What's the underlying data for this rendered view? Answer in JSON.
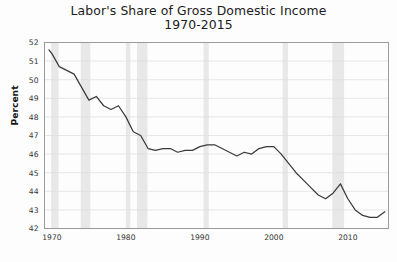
{
  "chart_data": {
    "type": "line",
    "title": "Labor's Share of Gross Domestic Income",
    "subtitle": "1970-2015",
    "xlabel": "",
    "ylabel": "Percent",
    "xlim": [
      1969,
      2015.5
    ],
    "ylim": [
      42,
      52
    ],
    "yticks": [
      42,
      43,
      44,
      45,
      46,
      47,
      48,
      49,
      50,
      51,
      52
    ],
    "ytick_labels": [
      "42",
      "43",
      "44",
      "45",
      "46",
      "47",
      "48",
      "49",
      "50",
      "51",
      "52"
    ],
    "xticks": [
      1970,
      1980,
      1990,
      2000,
      2010
    ],
    "xtick_labels": [
      "1970",
      "1980",
      "1990",
      "2000",
      "2010"
    ],
    "grid": "horizontal",
    "legend": "none",
    "line_color": "#3a3a3a",
    "recession_band_color": "#e8e8e8",
    "series": [
      {
        "name": "Labor's Share of Gross Domestic Income",
        "x": [
          1969.6,
          1970,
          1971,
          1972,
          1973,
          1974,
          1975,
          1976,
          1977,
          1978,
          1979,
          1980,
          1981,
          1982,
          1983,
          1984,
          1985,
          1986,
          1987,
          1988,
          1989,
          1990,
          1991,
          1992,
          1993,
          1994,
          1995,
          1996,
          1997,
          1998,
          1999,
          2000,
          2001,
          2002,
          2003,
          2004,
          2005,
          2006,
          2007,
          2008,
          2009,
          2010,
          2011,
          2012,
          2013,
          2014,
          2015
        ],
        "values": [
          51.6,
          51.4,
          50.7,
          50.5,
          50.3,
          49.6,
          48.9,
          49.1,
          48.6,
          48.4,
          48.6,
          48.0,
          47.2,
          47.0,
          46.3,
          46.2,
          46.3,
          46.3,
          46.1,
          46.2,
          46.2,
          46.4,
          46.5,
          46.5,
          46.3,
          46.1,
          45.9,
          46.1,
          46.0,
          46.3,
          46.4,
          46.4,
          46.0,
          45.5,
          45.0,
          44.6,
          44.2,
          43.8,
          43.6,
          43.9,
          44.4,
          43.6,
          43.0,
          42.7,
          42.6,
          42.6,
          42.9
        ]
      }
    ],
    "recession_bands": [
      {
        "start": 1969.9,
        "end": 1970.9
      },
      {
        "start": 1973.9,
        "end": 1975.2
      },
      {
        "start": 1980.0,
        "end": 1980.6
      },
      {
        "start": 1981.5,
        "end": 1982.9
      },
      {
        "start": 1990.5,
        "end": 1991.2
      },
      {
        "start": 2001.2,
        "end": 2001.9
      },
      {
        "start": 2007.9,
        "end": 2009.5
      }
    ]
  }
}
